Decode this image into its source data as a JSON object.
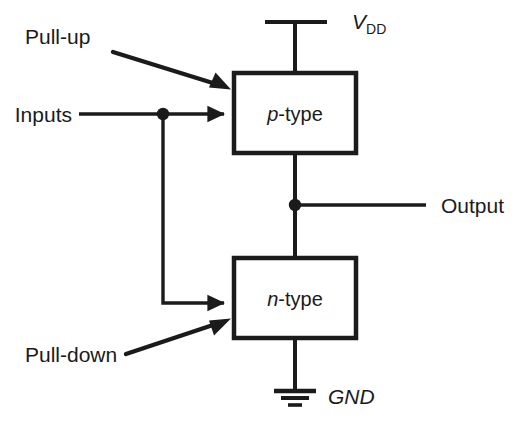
{
  "diagram": {
    "background_color": "#ffffff",
    "ink_color": "#1b1b1b",
    "blocks": [
      {
        "id": "p-type",
        "label_prefix": "p",
        "label_suffix": "-type",
        "x": 234,
        "y": 73,
        "w": 122,
        "h": 80
      },
      {
        "id": "n-type",
        "label_prefix": "n",
        "label_suffix": "-type",
        "x": 234,
        "y": 258,
        "w": 122,
        "h": 80
      }
    ],
    "labels": {
      "pull_up": "Pull-up",
      "pull_down": "Pull-down",
      "inputs": "Inputs",
      "output": "Output",
      "vdd_main": "V",
      "vdd_sub": "DD",
      "gnd": "GND",
      "p_type_prefix": "p",
      "p_type_suffix": "-type",
      "n_type_prefix": "n",
      "n_type_suffix": "-type"
    },
    "nodes": {
      "input_junction": {
        "x": 163,
        "y": 114
      },
      "output_junction": {
        "x": 295,
        "y": 205
      }
    },
    "rails": {
      "vdd_bar": {
        "x1": 265,
        "x2": 327,
        "y": 22
      },
      "gnd_lines": [
        {
          "x1": 274,
          "x2": 316,
          "y": 391
        },
        {
          "x1": 281,
          "x2": 309,
          "y": 398
        },
        {
          "x1": 288,
          "x2": 302,
          "y": 405
        }
      ]
    },
    "annotations": [
      {
        "name": "pull-up",
        "from_x": 113,
        "from_y": 52,
        "to_x": 229,
        "to_y": 88
      },
      {
        "name": "pull-down",
        "from_x": 126,
        "from_y": 354,
        "to_x": 229,
        "to_y": 319
      }
    ]
  }
}
